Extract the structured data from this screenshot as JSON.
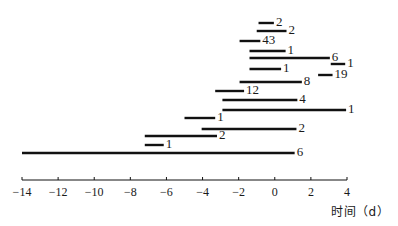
{
  "chart_data": {
    "type": "bar",
    "orientation": "horizontal-range",
    "title": "",
    "xlabel": "时间（d）",
    "ylabel": "",
    "xlim": [
      -14,
      4
    ],
    "xticks": [
      -14,
      -12,
      -10,
      -8,
      -6,
      -4,
      -2,
      0,
      2,
      4
    ],
    "grid": false,
    "legend": null,
    "series": [
      {
        "row": 1,
        "start": -0.9,
        "end": -0.05,
        "label": "2",
        "y": 23
      },
      {
        "row": 2,
        "start": -1.0,
        "end": 0.65,
        "label": "2",
        "y": 31
      },
      {
        "row": 3,
        "start": -1.95,
        "end": -0.8,
        "label": "43",
        "y": 41
      },
      {
        "row": 4,
        "start": -1.4,
        "end": 0.6,
        "label": "1",
        "y": 51
      },
      {
        "row": 5,
        "start": -1.4,
        "end": 3.05,
        "label": "6",
        "y": 58
      },
      {
        "row": 6,
        "start": 3.1,
        "end": 3.9,
        "label": "1",
        "y": 64
      },
      {
        "row": 7,
        "start": -1.4,
        "end": 0.35,
        "label": "1",
        "y": 69
      },
      {
        "row": 8,
        "start": 2.4,
        "end": 3.2,
        "label": "19",
        "y": 75
      },
      {
        "row": 9,
        "start": -1.95,
        "end": 1.5,
        "label": "8",
        "y": 82
      },
      {
        "row": 10,
        "start": -3.3,
        "end": -1.7,
        "label": "12",
        "y": 91
      },
      {
        "row": 11,
        "start": -2.9,
        "end": 1.25,
        "label": "4",
        "y": 100
      },
      {
        "row": 12,
        "start": -2.9,
        "end": 3.95,
        "label": "1",
        "y": 110
      },
      {
        "row": 13,
        "start": -5.0,
        "end": -3.3,
        "label": "1",
        "y": 118
      },
      {
        "row": 14,
        "start": -4.05,
        "end": 1.2,
        "label": "2",
        "y": 129
      },
      {
        "row": 15,
        "start": -7.2,
        "end": -3.2,
        "label": "2",
        "y": 136
      },
      {
        "row": 16,
        "start": -7.2,
        "end": -6.15,
        "label": "1",
        "y": 145
      },
      {
        "row": 17,
        "start": -14.0,
        "end": 1.1,
        "label": "6",
        "y": 153
      }
    ]
  },
  "axis": {
    "x0_px": 22,
    "x1_px": 347,
    "y_px": 180,
    "min": -14,
    "max": 4
  }
}
